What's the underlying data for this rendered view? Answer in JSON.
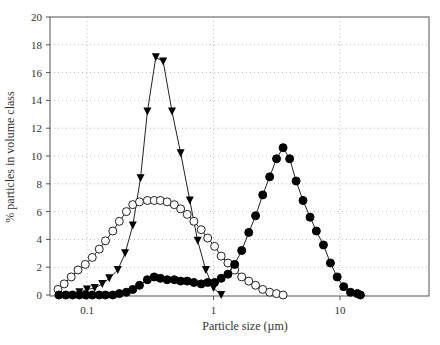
{
  "chart_data": {
    "type": "line",
    "title": "",
    "xlabel": "Particle size (µm)",
    "ylabel": "% particles in volume class",
    "xscale": "log",
    "xlim": [
      0.05,
      50
    ],
    "ylim": [
      0,
      20
    ],
    "yticks": [
      0,
      2,
      4,
      6,
      8,
      10,
      12,
      14,
      16,
      18,
      20
    ],
    "xticks": [
      {
        "value": 0.1,
        "label": "0.1"
      },
      {
        "value": 1,
        "label": "1"
      },
      {
        "value": 10,
        "label": "10"
      }
    ],
    "grid": true,
    "legend": "none",
    "series": [
      {
        "name": "triangles",
        "marker": "triangle-down-filled",
        "x": [
          0.087,
          0.1,
          0.115,
          0.132,
          0.15,
          0.175,
          0.2,
          0.23,
          0.265,
          0.3,
          0.35,
          0.4,
          0.47,
          0.55,
          0.65,
          0.75,
          0.87,
          1.0,
          1.15
        ],
        "y": [
          0.2,
          0.4,
          0.5,
          0.8,
          1.2,
          1.8,
          3.0,
          5.0,
          8.4,
          13.2,
          17.1,
          16.8,
          13.2,
          10.2,
          6.8,
          3.9,
          1.8,
          0.5,
          0.0
        ]
      },
      {
        "name": "open circles",
        "marker": "circle-open",
        "x": [
          0.059,
          0.066,
          0.075,
          0.085,
          0.097,
          0.11,
          0.125,
          0.14,
          0.16,
          0.18,
          0.205,
          0.23,
          0.26,
          0.3,
          0.34,
          0.38,
          0.43,
          0.49,
          0.55,
          0.62,
          0.7,
          0.8,
          0.9,
          1.02,
          1.15,
          1.3,
          1.47,
          1.67,
          1.9,
          2.15,
          2.45,
          2.78,
          3.15,
          3.55
        ],
        "y": [
          0.4,
          0.8,
          1.3,
          1.8,
          2.2,
          2.7,
          3.3,
          3.9,
          4.6,
          5.3,
          6.0,
          6.5,
          6.7,
          6.8,
          6.8,
          6.8,
          6.7,
          6.5,
          6.2,
          5.8,
          5.3,
          4.7,
          4.1,
          3.5,
          2.8,
          2.3,
          1.8,
          1.3,
          1.0,
          0.7,
          0.4,
          0.2,
          0.1,
          0.0
        ]
      },
      {
        "name": "filled circles",
        "marker": "circle-filled",
        "x": [
          0.06,
          0.068,
          0.077,
          0.087,
          0.098,
          0.11,
          0.125,
          0.14,
          0.16,
          0.18,
          0.205,
          0.23,
          0.26,
          0.3,
          0.34,
          0.38,
          0.43,
          0.49,
          0.55,
          0.62,
          0.7,
          0.8,
          0.9,
          1.02,
          1.15,
          1.3,
          1.47,
          1.67,
          1.9,
          2.15,
          2.45,
          2.78,
          3.15,
          3.55,
          4.0,
          4.5,
          5.1,
          5.8,
          6.5,
          7.4,
          8.4,
          9.5,
          10.7,
          12.1,
          13.7,
          14.5
        ],
        "y": [
          0.0,
          0.0,
          0.0,
          0.0,
          0.0,
          0.0,
          0.0,
          0.0,
          0.0,
          0.1,
          0.2,
          0.4,
          0.7,
          1.1,
          1.3,
          1.2,
          1.1,
          1.1,
          1.0,
          1.0,
          0.9,
          0.8,
          0.9,
          0.9,
          1.2,
          1.5,
          2.2,
          3.2,
          4.5,
          5.7,
          7.2,
          8.5,
          9.8,
          10.6,
          9.8,
          8.2,
          6.8,
          5.6,
          4.6,
          3.6,
          2.3,
          1.3,
          0.6,
          0.2,
          0.1,
          0.0
        ]
      }
    ]
  },
  "axis_labels": {
    "x": "Particle size (µm)",
    "y": "% particles in volume class"
  }
}
